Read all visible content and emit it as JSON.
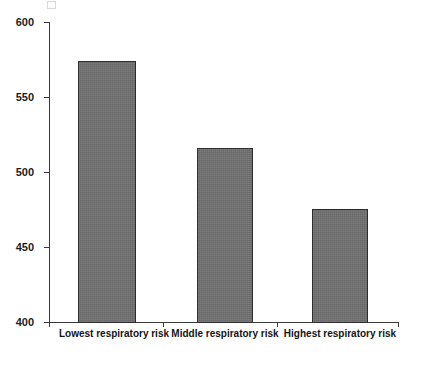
{
  "chart_data": {
    "type": "bar",
    "title": "",
    "subtitle": "",
    "xlabel": "",
    "ylabel": "",
    "categories": [
      "Lowest respiratory risk",
      "Middle respiratory risk",
      "Highest respiratory risk"
    ],
    "values": [
      574,
      516,
      476
    ],
    "ylim": [
      400,
      600
    ],
    "yticks": [
      400,
      450,
      500,
      550,
      600
    ],
    "ytick_labels": [
      "400",
      "450",
      "500",
      "550",
      "600"
    ],
    "grid": false,
    "legend": null,
    "legend_position": "none",
    "series": [
      {
        "name": "",
        "values": [
          574,
          516,
          476
        ]
      }
    ],
    "bar_color": "#706f70",
    "bar_edge_color": "#2e2e2e",
    "axis_color": "#3a3a3a"
  },
  "caption": {
    "line1": "",
    "line2": ""
  }
}
